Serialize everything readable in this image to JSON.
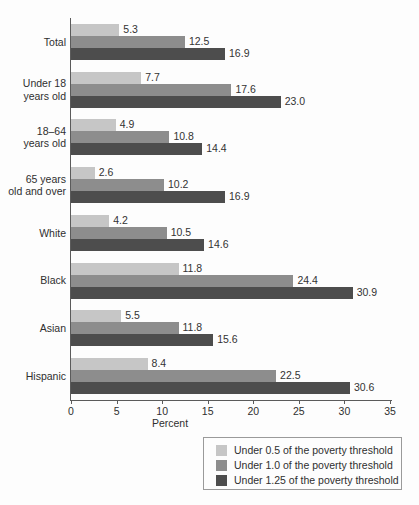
{
  "chart_data": {
    "type": "bar",
    "orientation": "horizontal",
    "title": "",
    "xlabel": "Percent",
    "ylabel": "",
    "xlim": [
      0,
      35
    ],
    "xticks": [
      0,
      5,
      10,
      15,
      20,
      25,
      30,
      35
    ],
    "grid": false,
    "legend_position": "bottom-right",
    "categories": [
      "Total",
      "Under 18\nyears old",
      "18–64\nyears old",
      "65 years\nold and over",
      "White",
      "Black",
      "Asian",
      "Hispanic"
    ],
    "category_lines": [
      [
        "Total"
      ],
      [
        "Under 18",
        "years old"
      ],
      [
        "18–64",
        "years old"
      ],
      [
        "65 years",
        "old and over"
      ],
      [
        "White"
      ],
      [
        "Black"
      ],
      [
        "Asian"
      ],
      [
        "Hispanic"
      ]
    ],
    "series": [
      {
        "name": "Under 0.5 of the poverty threshold",
        "color": "#c6c6c6",
        "values": [
          5.3,
          7.7,
          4.9,
          2.6,
          4.2,
          11.8,
          5.5,
          8.4
        ],
        "labels": [
          "5.3",
          "7.7",
          "4.9",
          "2.6",
          "4.2",
          "11.8",
          "5.5",
          "8.4"
        ]
      },
      {
        "name": "Under 1.0 of the poverty threshold",
        "color": "#8d8d8d",
        "values": [
          12.5,
          17.6,
          10.8,
          10.2,
          10.5,
          24.4,
          11.8,
          22.5
        ],
        "labels": [
          "12.5",
          "17.6",
          "10.8",
          "10.2",
          "10.5",
          "24.4",
          "11.8",
          "22.5"
        ]
      },
      {
        "name": "Under 1.25 of the poverty threshold",
        "color": "#4d4d4d",
        "values": [
          16.9,
          23.0,
          14.4,
          16.9,
          14.6,
          30.9,
          15.6,
          30.6
        ],
        "labels": [
          "16.9",
          "23.0",
          "14.4",
          "16.9",
          "14.6",
          "30.9",
          "15.6",
          "30.6"
        ]
      }
    ]
  },
  "axis": {
    "x_title": "Percent",
    "tick_labels": [
      "0",
      "5",
      "10",
      "15",
      "20",
      "25",
      "30",
      "35"
    ]
  },
  "legend": {
    "items": [
      {
        "label": "Under 0.5 of the poverty threshold",
        "color": "#c6c6c6"
      },
      {
        "label": "Under 1.0 of the poverty threshold",
        "color": "#8d8d8d"
      },
      {
        "label": "Under 1.25 of the poverty threshold",
        "color": "#4d4d4d"
      }
    ]
  },
  "colors": {
    "series_0": "#c6c6c6",
    "series_1": "#8d8d8d",
    "series_2": "#4d4d4d",
    "axis": "#5b5b5b",
    "text": "#2f2f2f",
    "background": "#fdfdfd"
  }
}
